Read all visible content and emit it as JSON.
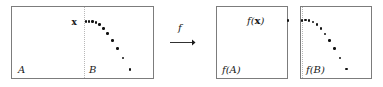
{
  "figure": {
    "type": "math-diagram",
    "colors": {
      "border": "#7c7c7c",
      "dotted_divider": "#b8b8b8",
      "point": "#111111",
      "text": "#1a1a1a",
      "background": "#ffffff"
    }
  },
  "source_panel": {
    "region_a_label": "A",
    "region_b_label": "B",
    "point_label": "x",
    "divider_style": "dotted",
    "points": [
      {
        "x": 86.0,
        "y": 21.5
      },
      {
        "x": 89.2,
        "y": 21.4
      },
      {
        "x": 92.4,
        "y": 21.6
      },
      {
        "x": 95.8,
        "y": 22.4
      },
      {
        "x": 99.6,
        "y": 24.6
      },
      {
        "x": 103.4,
        "y": 28.4
      },
      {
        "x": 107.6,
        "y": 33.6
      },
      {
        "x": 112.4,
        "y": 40.4
      },
      {
        "x": 117.4,
        "y": 48.6
      },
      {
        "x": 123.0,
        "y": 58.2
      },
      {
        "x": 129.8,
        "y": 69.4
      }
    ]
  },
  "map": {
    "function_label": "f",
    "arrow": "⟶"
  },
  "target_panel_a": {
    "region_label": "f(A)",
    "point_label": "f(x)",
    "image_point": {
      "x": 288.0,
      "y": 20.6
    }
  },
  "target_panel_b": {
    "region_label": "f(B)",
    "divider_style": "dotted",
    "points": [
      {
        "x": 302.2,
        "y": 20.4
      },
      {
        "x": 305.6,
        "y": 20.2
      },
      {
        "x": 309.2,
        "y": 20.6
      },
      {
        "x": 312.8,
        "y": 22.0
      },
      {
        "x": 316.8,
        "y": 24.6
      },
      {
        "x": 320.8,
        "y": 28.6
      },
      {
        "x": 325.0,
        "y": 33.8
      },
      {
        "x": 329.6,
        "y": 40.4
      },
      {
        "x": 334.6,
        "y": 48.6
      },
      {
        "x": 340.0,
        "y": 58.0
      },
      {
        "x": 346.4,
        "y": 69.0
      }
    ]
  },
  "geometry": {
    "source_panel": {
      "left": 11,
      "top": 6,
      "width": 143,
      "height": 73
    },
    "source_divider_x": 84,
    "target_a_panel": {
      "left": 216,
      "top": 6,
      "width": 72,
      "height": 73
    },
    "target_b_panel": {
      "left": 300,
      "top": 6,
      "width": 72,
      "height": 73
    },
    "target_b_divider_x": 302,
    "map_label_pos": {
      "left": 178,
      "top": 23
    },
    "arrow_pos": {
      "left": 170,
      "top": 38
    }
  }
}
